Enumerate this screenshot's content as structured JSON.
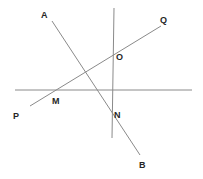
{
  "figure": {
    "width": 203,
    "height": 179,
    "background_color": "#ffffff",
    "line_color": "#8a8a8a",
    "label_color": "#262626",
    "line_width": 1
  },
  "lines": [
    {
      "name": "horizontal-line",
      "label": "",
      "x1": 15,
      "y1": 90,
      "x2": 192,
      "y2": 90,
      "color": "#8a8a8a"
    },
    {
      "name": "vertical-line",
      "label": "",
      "x1": 114,
      "y1": 8,
      "x2": 112,
      "y2": 138,
      "color": "#8a8a8a"
    },
    {
      "name": "line-pq",
      "label": "PQ",
      "x1": 30,
      "y1": 106,
      "x2": 161,
      "y2": 26,
      "color": "#8a8a8a"
    },
    {
      "name": "line-ab",
      "label": "AB",
      "x1": 52,
      "y1": 21,
      "x2": 140,
      "y2": 155,
      "color": "#8a8a8a"
    }
  ],
  "labels": [
    {
      "name": "label-a",
      "text": "A",
      "x": 41,
      "y": 11
    },
    {
      "name": "label-q",
      "text": "Q",
      "x": 160,
      "y": 16
    },
    {
      "name": "label-o",
      "text": "O",
      "x": 116,
      "y": 53
    },
    {
      "name": "label-m",
      "text": "M",
      "x": 52,
      "y": 97
    },
    {
      "name": "label-p",
      "text": "P",
      "x": 13,
      "y": 112
    },
    {
      "name": "label-n",
      "text": "N",
      "x": 114,
      "y": 111
    },
    {
      "name": "label-b",
      "text": "B",
      "x": 139,
      "y": 161
    }
  ],
  "chart_data": {
    "type": "diagram",
    "xlabel": "",
    "ylabel": "",
    "xlim": [
      0,
      203
    ],
    "ylim": [
      179,
      0
    ],
    "grid": false,
    "legend": "none",
    "elements": [
      {
        "kind": "segment",
        "id": "horizontal-line",
        "endpoints": [
          [
            15,
            90
          ],
          [
            192,
            90
          ]
        ],
        "endpoint_labels": [
          "",
          ""
        ]
      },
      {
        "kind": "segment",
        "id": "vertical-line",
        "endpoints": [
          [
            114,
            8
          ],
          [
            112,
            138
          ]
        ],
        "endpoint_labels": [
          "",
          ""
        ]
      },
      {
        "kind": "segment",
        "id": "line-pq",
        "endpoints": [
          [
            30,
            106
          ],
          [
            161,
            26
          ]
        ],
        "endpoint_labels": [
          "P",
          "Q"
        ]
      },
      {
        "kind": "segment",
        "id": "line-ab",
        "endpoints": [
          [
            52,
            21
          ],
          [
            140,
            155
          ]
        ],
        "endpoint_labels": [
          "A",
          "B"
        ]
      }
    ],
    "points": [
      {
        "label": "A",
        "x": 52,
        "y": 21,
        "role": "endpoint of line AB"
      },
      {
        "label": "B",
        "x": 140,
        "y": 155,
        "role": "endpoint of line AB"
      },
      {
        "label": "P",
        "x": 30,
        "y": 106,
        "role": "endpoint of line PQ"
      },
      {
        "label": "Q",
        "x": 161,
        "y": 26,
        "role": "endpoint of line PQ"
      },
      {
        "label": "M",
        "x": 50,
        "y": 90,
        "role": "intersection of line PQ and horizontal line"
      },
      {
        "label": "N",
        "x": 112,
        "y": 112,
        "role": "intersection of line AB and vertical line"
      },
      {
        "label": "O",
        "x": 113,
        "y": 53,
        "role": "intersection of line PQ and vertical line"
      }
    ]
  }
}
